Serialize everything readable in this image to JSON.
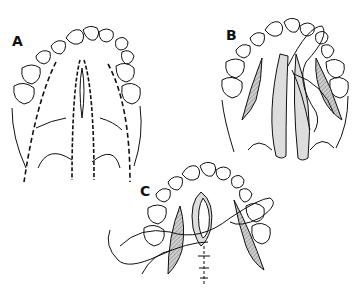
{
  "figure": {
    "panels": [
      {
        "id": "A",
        "label": "A",
        "content": "Cleft palate with dashed incision lines along alveolar ridges and cleft margins"
      },
      {
        "id": "B",
        "label": "B",
        "content": "Mucoperiosteal flaps elevated with relaxing incisions (hatched), sutures being placed"
      },
      {
        "id": "C",
        "label": "C",
        "content": "Flaps approximated with sutures across midline, lateral relaxing incisions packed (hatched)"
      }
    ]
  },
  "colors": {
    "ink": "#111111",
    "hatch": "#9a9a9a",
    "background": "#ffffff"
  }
}
